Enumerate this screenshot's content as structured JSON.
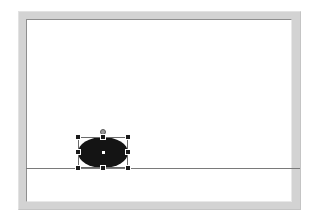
{
  "canvas": {
    "page_color": "#ffffff",
    "frame_color": "#d3d3d3"
  },
  "drawing": {
    "baseline": {
      "type": "horizontal-line",
      "color": "#7a7a7a"
    },
    "shape": {
      "type": "ellipse",
      "fill": "#141414",
      "selected": true,
      "handles": [
        "top-left",
        "top-center",
        "top-right",
        "middle-left",
        "middle-right",
        "bottom-left",
        "bottom-center",
        "bottom-right"
      ],
      "rotation_handle": true,
      "center_marker": true
    }
  }
}
